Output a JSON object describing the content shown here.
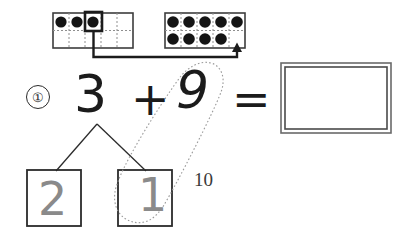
{
  "worksheet": {
    "problem_number": "①",
    "equation": {
      "first_addend": "3",
      "plus_sign": "+",
      "second_addend": "9",
      "equals_sign": "=",
      "answer": ""
    },
    "number_bond": {
      "whole": "3",
      "part_left": "2",
      "part_right": "1"
    },
    "make_ten_label": "10",
    "ten_frames": [
      {
        "name": "left-ten-frame",
        "columns": 5,
        "rows": 2,
        "filled_count": 3,
        "top_row_dots": 3,
        "bottom_row_dots": 0,
        "highlighted_cell_index": 2
      },
      {
        "name": "right-ten-frame",
        "columns": 5,
        "rows": 2,
        "filled_count": 9,
        "top_row_dots": 5,
        "bottom_row_dots": 4,
        "highlighted_cell_index": null
      }
    ],
    "arrow": {
      "label": "move-one-arrow",
      "from": "left-ten-frame-highlighted-cell",
      "to": "right-ten-frame-empty-cell"
    },
    "colors": {
      "ink": "#1b1b1b",
      "dot_fill": "#141414",
      "grid_line": "#4a4a4a",
      "dotted_grid": "#8f8f8f",
      "traced_number": "#8a8a8a",
      "loop_outline": "#9a9a9a",
      "answer_box_border": "#4a4a4a",
      "background": "#ffffff"
    }
  }
}
